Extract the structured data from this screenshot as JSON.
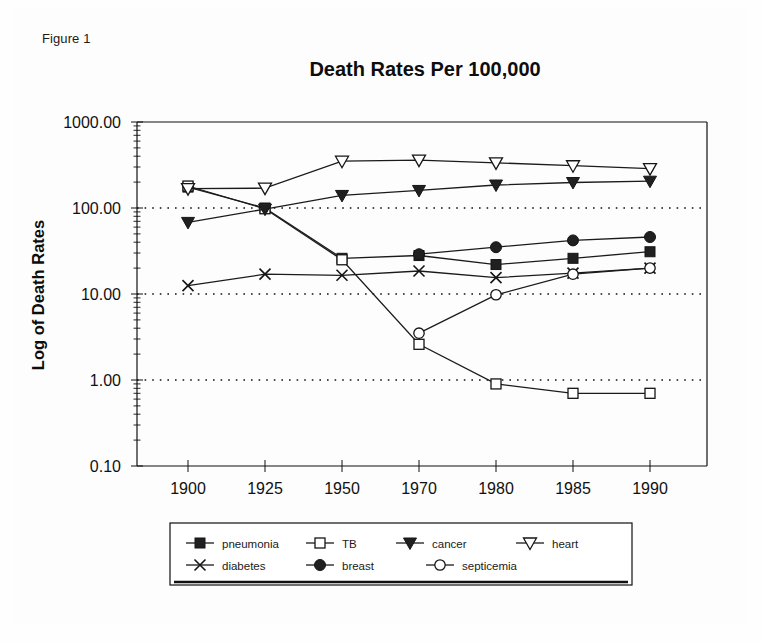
{
  "figure": {
    "label": "Figure 1"
  },
  "chart_data": {
    "type": "line",
    "title": "Death Rates Per 100,000",
    "xlabel": "",
    "ylabel": "Log of Death Rates",
    "yscale": "log",
    "ylim": [
      0.1,
      1000.0
    ],
    "grid": "horizontal-dotted",
    "legend_position": "bottom",
    "categories": [
      "1900",
      "1925",
      "1950",
      "1970",
      "1980",
      "1985",
      "1990"
    ],
    "x": [
      1900,
      1925,
      1950,
      1970,
      1980,
      1985,
      1990
    ],
    "ytick_labels": [
      "1000.00",
      "100.00",
      "10.00",
      "1.00",
      "0.10"
    ],
    "ytick_values": [
      1000.0,
      100.0,
      10.0,
      1.0,
      0.1
    ],
    "series": [
      {
        "name": "pneumonia",
        "marker": "filled-square",
        "values": [
          175,
          100,
          26,
          28,
          22,
          26,
          31
        ]
      },
      {
        "name": "TB",
        "marker": "open-square",
        "values": [
          180,
          98,
          25,
          2.6,
          0.9,
          0.7,
          0.7
        ]
      },
      {
        "name": "cancer",
        "marker": "filled-triangle-down",
        "values": [
          68,
          97,
          140,
          160,
          185,
          198,
          205
        ]
      },
      {
        "name": "heart",
        "marker": "open-triangle-down",
        "values": [
          168,
          170,
          350,
          360,
          335,
          310,
          287
        ]
      },
      {
        "name": "diabetes",
        "marker": "cross",
        "values": [
          12.5,
          17,
          16.5,
          18.5,
          15.5,
          17.5,
          20
        ]
      },
      {
        "name": "breast",
        "marker": "filled-circle",
        "values": [
          null,
          null,
          null,
          29,
          35,
          42,
          46
        ]
      },
      {
        "name": "septicemia",
        "marker": "open-circle",
        "values": [
          null,
          null,
          null,
          3.5,
          9.8,
          17,
          20
        ]
      }
    ]
  },
  "legend": {
    "row1": [
      "pneumonia",
      "TB",
      "cancer",
      "heart"
    ],
    "row2": [
      "diabetes",
      "breast",
      "septicemia"
    ]
  }
}
